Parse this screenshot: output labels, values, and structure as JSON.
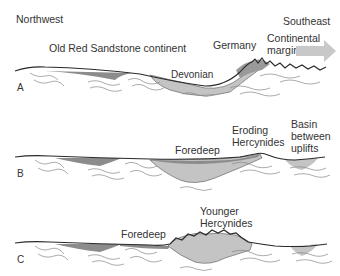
{
  "diagram": {
    "directions": {
      "left": "Northwest",
      "right": "Southeast"
    },
    "panels": [
      {
        "id": "A",
        "letter": "A",
        "labels": {
          "continent": "Old Red Sandstone continent",
          "germany": "Germany",
          "margin_line1": "Continental",
          "margin_line2": "margin",
          "devonian": "Devonian"
        }
      },
      {
        "id": "B",
        "letter": "B",
        "labels": {
          "foredeep": "Foredeep",
          "eroding_line1": "Eroding",
          "eroding_line2": "Hercynides",
          "basin_line1": "Basin",
          "basin_line2": "between",
          "basin_line3": "uplifts"
        }
      },
      {
        "id": "C",
        "letter": "C",
        "labels": {
          "foredeep": "Foredeep",
          "younger_line1": "Younger",
          "younger_line2": "Hercynides"
        }
      }
    ],
    "colors": {
      "dark_sediment": "#8c8c8c",
      "light_sediment": "#c4c4c4",
      "arrow": "#c8c8c8",
      "line": "#2a2a2a",
      "basement": "#9a9a9a"
    }
  }
}
